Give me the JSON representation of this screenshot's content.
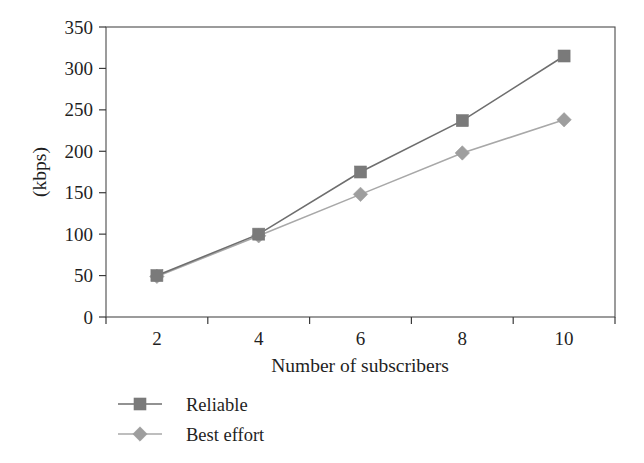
{
  "chart_data": {
    "type": "line",
    "title": "",
    "xlabel": "Number of subscribers",
    "ylabel": "(kbps)",
    "categories": [
      "2",
      "4",
      "6",
      "8",
      "10"
    ],
    "x": [
      2,
      4,
      6,
      8,
      10
    ],
    "xlim": [
      1,
      11
    ],
    "ylim": [
      0,
      350
    ],
    "yticks": [
      "0",
      "50",
      "100",
      "150",
      "200",
      "250",
      "300",
      "350"
    ],
    "ytick_values": [
      0,
      50,
      100,
      150,
      200,
      250,
      300,
      350
    ],
    "grid": false,
    "legend_position": "bottom",
    "frame": "box",
    "series": [
      {
        "name": "Reliable",
        "marker": "square",
        "color": "#7a7a7a",
        "line_color": "#6e6e6e",
        "values": [
          50,
          100,
          175,
          237,
          315
        ]
      },
      {
        "name": "Best effort",
        "marker": "diamond",
        "color": "#9e9e9e",
        "line_color": "#a8a8a8",
        "values": [
          49,
          98,
          148,
          198,
          238
        ]
      }
    ]
  },
  "legend": {
    "items": [
      {
        "label": "Reliable"
      },
      {
        "label": "Best effort"
      }
    ]
  },
  "axes": {
    "y_title": "(kbps)",
    "x_title": "Number of subscribers"
  }
}
